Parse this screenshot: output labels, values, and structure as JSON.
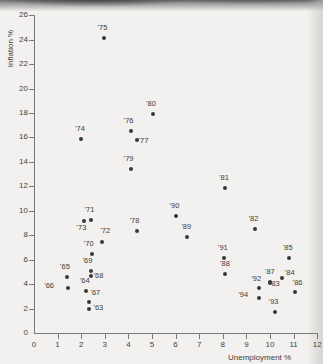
{
  "figure": {
    "axis_title_x": "Unemployment %",
    "axis_title_y": "Inflation %"
  },
  "chart_data": {
    "type": "scatter",
    "title": "",
    "xlabel": "Unemployment %",
    "ylabel": "Inflation %",
    "xlim": [
      0,
      12
    ],
    "ylim": [
      0,
      26
    ],
    "xticks": [
      0,
      1,
      2,
      3,
      4,
      5,
      6,
      7,
      8,
      9,
      10,
      11,
      12
    ],
    "yticks": [
      0,
      2,
      4,
      6,
      8,
      10,
      12,
      14,
      16,
      18,
      20,
      22,
      24,
      26
    ],
    "grid": false,
    "legend": null,
    "point_color": "#3a3836",
    "axis_color": "#7c7a78",
    "points": [
      {
        "label": "'63",
        "x": 2.35,
        "y": 2.0,
        "lx": 8,
        "ly": -3
      },
      {
        "label": "'64",
        "x": 2.2,
        "y": 3.45,
        "lx": -2,
        "ly": -12
      },
      {
        "label": "'65",
        "x": 1.4,
        "y": 4.55,
        "lx": -3,
        "ly": -12
      },
      {
        "label": "'66",
        "x": 1.45,
        "y": 3.7,
        "lx": -20,
        "ly": -4
      },
      {
        "label": "'67",
        "x": 2.35,
        "y": 2.5,
        "lx": 5,
        "ly": -11
      },
      {
        "label": "'68",
        "x": 2.4,
        "y": 4.65,
        "lx": 7,
        "ly": -2
      },
      {
        "label": "'69",
        "x": 2.4,
        "y": 5.1,
        "lx": -4,
        "ly": -12
      },
      {
        "label": "'70",
        "x": 2.45,
        "y": 6.45,
        "lx": -4,
        "ly": -12
      },
      {
        "label": "'71",
        "x": 2.4,
        "y": 9.25,
        "lx": -2,
        "ly": -12
      },
      {
        "label": "'72",
        "x": 2.9,
        "y": 7.45,
        "lx": 2,
        "ly": -13
      },
      {
        "label": "'73",
        "x": 2.1,
        "y": 9.2,
        "lx": -3,
        "ly": 5
      },
      {
        "label": "'74",
        "x": 2.0,
        "y": 15.85,
        "lx": -2,
        "ly": -12
      },
      {
        "label": "'75",
        "x": 2.95,
        "y": 24.1,
        "lx": -2,
        "ly": -12
      },
      {
        "label": "'76",
        "x": 4.1,
        "y": 16.5,
        "lx": -3,
        "ly": -12
      },
      {
        "label": "'77",
        "x": 4.35,
        "y": 15.8,
        "lx": 6,
        "ly": -1
      },
      {
        "label": "'78",
        "x": 4.35,
        "y": 8.35,
        "lx": -3,
        "ly": -12
      },
      {
        "label": "'79",
        "x": 4.1,
        "y": 13.45,
        "lx": -3,
        "ly": -12
      },
      {
        "label": "'80",
        "x": 5.05,
        "y": 17.95,
        "lx": -3,
        "ly": -12
      },
      {
        "label": "'81",
        "x": 8.1,
        "y": 11.9,
        "lx": -2,
        "ly": -12
      },
      {
        "label": "'82",
        "x": 9.35,
        "y": 8.5,
        "lx": -2,
        "ly": -12
      },
      {
        "label": "'83",
        "x": 10.0,
        "y": 4.1,
        "lx": 4,
        "ly": -1
      },
      {
        "label": "'84",
        "x": 10.5,
        "y": 4.5,
        "lx": 7,
        "ly": -7
      },
      {
        "label": "'85",
        "x": 10.8,
        "y": 6.1,
        "lx": -2,
        "ly": -12
      },
      {
        "label": "'86",
        "x": 11.05,
        "y": 3.35,
        "lx": 2,
        "ly": -11
      },
      {
        "label": "'87",
        "x": 10.0,
        "y": 4.15,
        "lx": -1,
        "ly": -12
      },
      {
        "label": "'88",
        "x": 8.1,
        "y": 4.85,
        "lx": -1,
        "ly": -12
      },
      {
        "label": "'89",
        "x": 6.5,
        "y": 7.85,
        "lx": -2,
        "ly": -12
      },
      {
        "label": "'90",
        "x": 6.0,
        "y": 9.6,
        "lx": -2,
        "ly": -12
      },
      {
        "label": "'91",
        "x": 8.05,
        "y": 6.15,
        "lx": -2,
        "ly": -12
      },
      {
        "label": "'92",
        "x": 9.55,
        "y": 3.7,
        "lx": -4,
        "ly": -11
      },
      {
        "label": "'93",
        "x": 10.2,
        "y": 1.7,
        "lx": -2,
        "ly": -12
      },
      {
        "label": "'94",
        "x": 9.55,
        "y": 2.9,
        "lx": -17,
        "ly": -5
      }
    ]
  }
}
